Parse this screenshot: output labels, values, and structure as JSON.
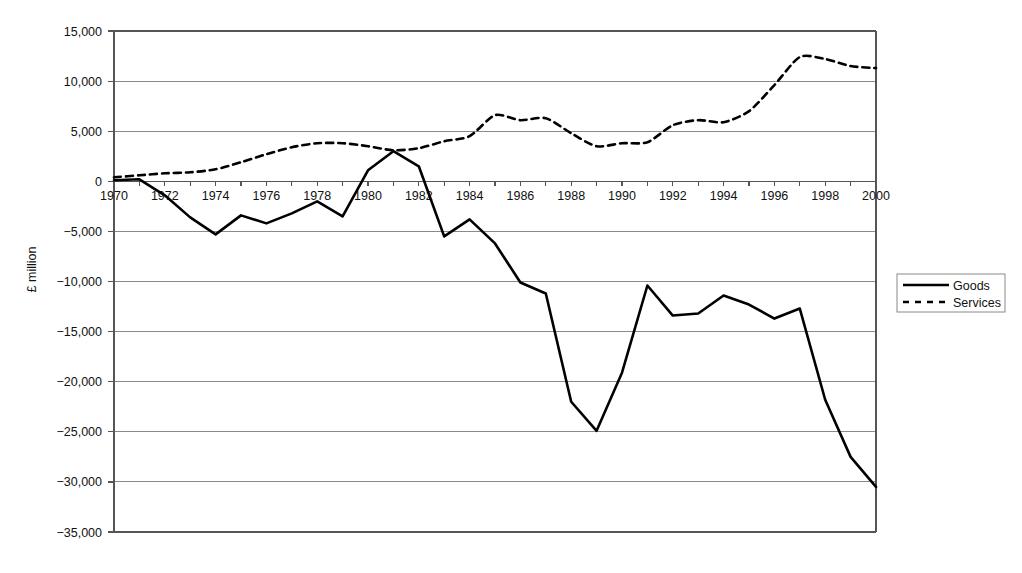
{
  "chart_data": {
    "type": "line",
    "title": "",
    "subtitle": "",
    "xlabel": "",
    "ylabel": "£ million",
    "xlim": [
      1970,
      2000
    ],
    "ylim": [
      -35000,
      15000
    ],
    "grid": true,
    "legend_position": "right",
    "y_ticks": [
      15000,
      10000,
      5000,
      0,
      -5000,
      -10000,
      -15000,
      -20000,
      -25000,
      -30000,
      -35000
    ],
    "y_tick_labels": [
      "15,000",
      "10,000",
      "5,000",
      "0",
      "−5,000",
      "−10,000",
      "−15,000",
      "−20,000",
      "−25,000",
      "−30,000",
      "−35,000"
    ],
    "x_ticks": [
      1970,
      1971,
      1972,
      1973,
      1974,
      1975,
      1976,
      1977,
      1978,
      1979,
      1980,
      1981,
      1982,
      1983,
      1984,
      1985,
      1986,
      1987,
      1988,
      1989,
      1990,
      1991,
      1992,
      1993,
      1994,
      1995,
      1996,
      1997,
      1998,
      1999,
      2000
    ],
    "x_tick_labels": [
      "1970",
      "",
      "1972",
      "",
      "1974",
      "",
      "1976",
      "",
      "1978",
      "",
      "1980",
      "",
      "1982",
      "",
      "1984",
      "",
      "1986",
      "",
      "1988",
      "",
      "1990",
      "",
      "1992",
      "",
      "1994",
      "",
      "1996",
      "",
      "1998",
      "",
      "2000"
    ],
    "x": [
      1970,
      1971,
      1972,
      1973,
      1974,
      1975,
      1976,
      1977,
      1978,
      1979,
      1980,
      1981,
      1982,
      1983,
      1984,
      1985,
      1986,
      1987,
      1988,
      1989,
      1990,
      1991,
      1992,
      1993,
      1994,
      1995,
      1996,
      1997,
      1998,
      1999,
      2000
    ],
    "series": [
      {
        "name": "Goods",
        "style": "solid",
        "values": [
          100,
          200,
          -1400,
          -3600,
          -5300,
          -3400,
          -4200,
          -3200,
          -2000,
          -3500,
          1100,
          3000,
          1500,
          -5500,
          -3800,
          -6200,
          -10100,
          -11200,
          -22000,
          -24900,
          -19100,
          -10400,
          -13400,
          -13200,
          -11400,
          -12300,
          -13700,
          -12700,
          -21800,
          -27500,
          -30500
        ]
      },
      {
        "name": "Services",
        "style": "dashed",
        "values": [
          400,
          600,
          800,
          900,
          1200,
          1900,
          2700,
          3400,
          3800,
          3800,
          3500,
          3100,
          3300,
          4000,
          4500,
          6600,
          6100,
          6300,
          4800,
          3500,
          3800,
          3900,
          5600,
          6100,
          5900,
          7000,
          9600,
          12400,
          12200,
          11500,
          11300
        ]
      }
    ]
  },
  "legend": {
    "items": [
      {
        "label": "Goods",
        "style": "solid"
      },
      {
        "label": "Services",
        "style": "dashed"
      }
    ]
  }
}
